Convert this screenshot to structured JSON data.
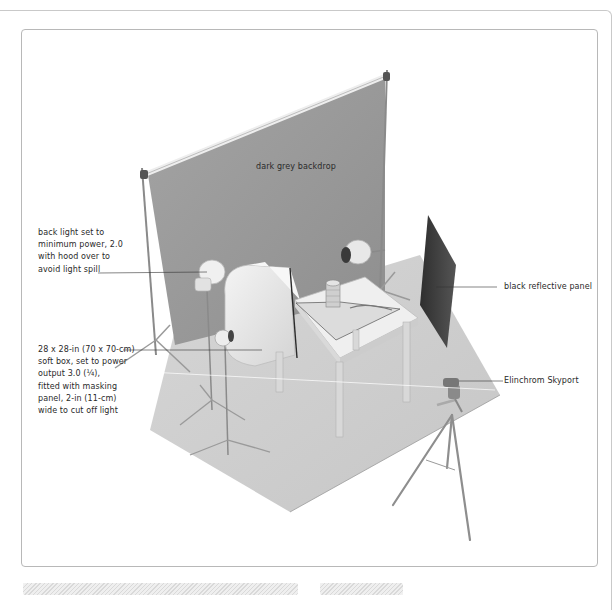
{
  "diagram": {
    "labels": {
      "backdrop": "dark grey backdrop",
      "back_light": [
        "back light set to",
        "minimum power, 2.0",
        "with hood over to",
        "avoid light spill"
      ],
      "reflective_panel": "black reflective panel",
      "soft_box": [
        "28 x 28-in (70 x 70-cm)",
        "soft box, set to power",
        "output 3.0 (¼),",
        "fitted with masking",
        "panel, 2-in (11-cm)",
        "wide to cut off light"
      ],
      "trigger": "Elinchrom Skyport"
    },
    "objects": [
      "backdrop-stand",
      "back-light",
      "rear-light-with-hood",
      "soft-box",
      "table",
      "coin-stack",
      "spoon",
      "black-reflective-panel",
      "camera-on-tripod",
      "floor-sheet"
    ],
    "colors": {
      "backdrop": "#9a9a9a",
      "panel": "#3e3e3e",
      "floor": "#cfcfcf",
      "label_text": "#2a2a2a",
      "leader_line": "#333333",
      "frame": "#b8b8b8"
    }
  },
  "footer": {
    "placeholders": [
      "caption-bar-long",
      "caption-bar-short"
    ]
  }
}
